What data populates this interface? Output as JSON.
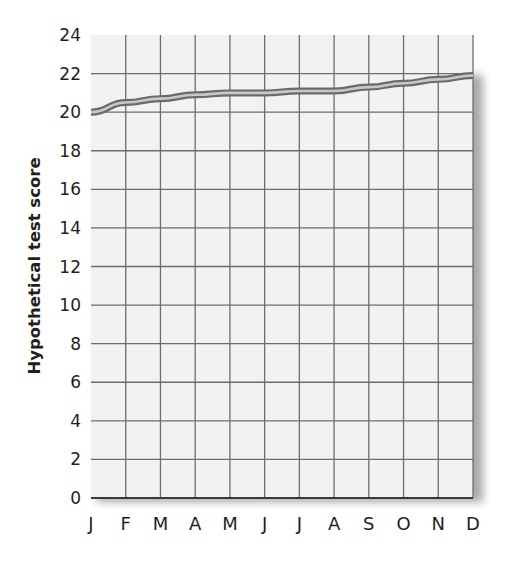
{
  "chart_data": {
    "type": "line",
    "title": "",
    "xlabel": "",
    "ylabel": "Hypothetical test score",
    "categories": [
      "J",
      "F",
      "M",
      "A",
      "M",
      "J",
      "J",
      "A",
      "S",
      "O",
      "N",
      "D"
    ],
    "series": [
      {
        "name": "Hypothetical test score",
        "values": [
          20.0,
          20.5,
          20.7,
          20.9,
          21.0,
          21.0,
          21.1,
          21.1,
          21.3,
          21.5,
          21.7,
          21.9
        ]
      }
    ],
    "yticks": [
      0,
      2,
      4,
      6,
      8,
      10,
      12,
      14,
      16,
      18,
      20,
      22,
      24
    ],
    "ylim": [
      0,
      24
    ],
    "grid": true,
    "legend": null
  },
  "colors": {
    "plot_background": "#f2f2f2",
    "grid_line": "#6d6d6d",
    "axis_line": "#3a3a3a",
    "series_outline": "#6a6a6a",
    "series_fill": "#c8c8c8",
    "text": "#231f20",
    "shadow": "#8a8a8a"
  }
}
